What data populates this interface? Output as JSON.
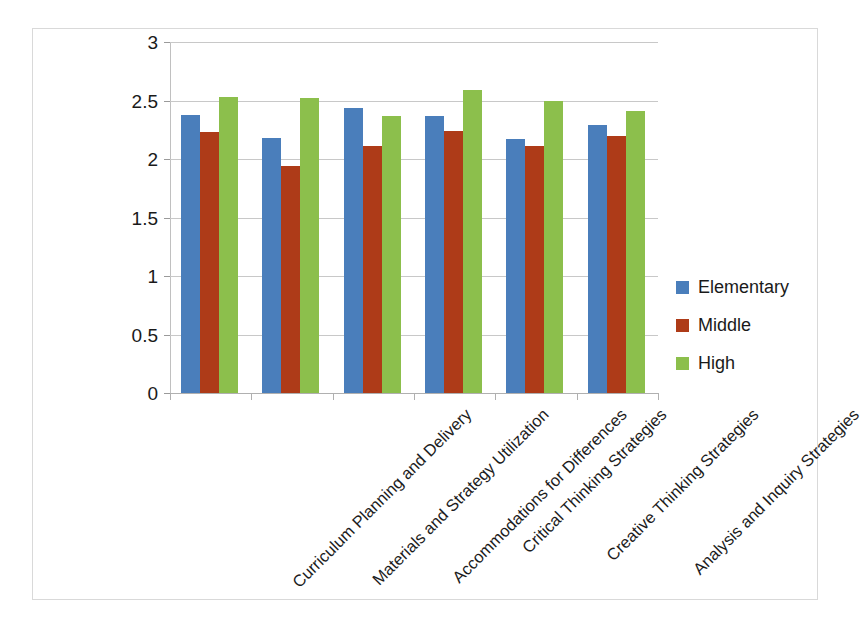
{
  "chart_data": {
    "type": "bar",
    "title": "",
    "subtitle": "",
    "xlabel": "",
    "ylabel": "",
    "ylim": [
      0,
      3
    ],
    "ytick_labels": [
      "0",
      "0.5",
      "1",
      "1.5",
      "2",
      "2.5",
      "3"
    ],
    "ytick_values": [
      0,
      0.5,
      1,
      1.5,
      2,
      2.5,
      3
    ],
    "grid": true,
    "grid_axis": "y",
    "legend_position": "right",
    "bar_mode": "grouped",
    "categories": [
      "Curriculum Planning and Delivery",
      "Materials and Strategy Utilization",
      "Accommodations for Differences",
      "Critical Thinking Strategies",
      "Creative Thinking Strategies",
      "Analysis and Inquiry Strategies"
    ],
    "series": [
      {
        "name": "Elementary",
        "color": "#4A7EBB",
        "values": [
          2.38,
          2.18,
          2.44,
          2.37,
          2.17,
          2.29
        ]
      },
      {
        "name": "Middle",
        "color": "#AE3B18",
        "values": [
          2.23,
          1.94,
          2.11,
          2.24,
          2.11,
          2.2
        ]
      },
      {
        "name": "High",
        "color": "#8CBF4C",
        "values": [
          2.53,
          2.52,
          2.37,
          2.59,
          2.5,
          2.41
        ]
      }
    ]
  },
  "legend": {
    "items": [
      {
        "label": "Elementary",
        "color": "#4A7EBB"
      },
      {
        "label": "Middle",
        "color": "#AE3B18"
      },
      {
        "label": "High",
        "color": "#8CBF4C"
      }
    ]
  },
  "colors": {
    "elementary": "#4A7EBB",
    "middle": "#AE3B18",
    "high": "#8CBF4C",
    "gridline": "#c8c8c8",
    "axis": "#b0b0b0",
    "frame": "#d9d9d9",
    "text": "#1a1a1a",
    "background": "#ffffff"
  }
}
